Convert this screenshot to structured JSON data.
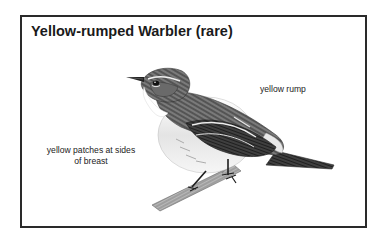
{
  "card": {
    "title": "Yellow-rumped Warbler (rare)",
    "illustration": "warbler-perched-on-branch",
    "labels": {
      "rump": "yellow rump",
      "breast_line1": "yellow patches at sides",
      "breast_line2": "of breast"
    }
  },
  "colors": {
    "border": "#2a2a2a",
    "text": "#1a1a1a",
    "background": "#ffffff"
  }
}
